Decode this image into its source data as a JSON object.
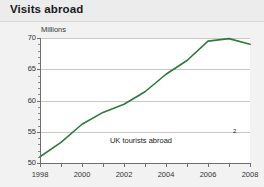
{
  "header": {
    "title": "Visits abroad"
  },
  "chart_data": {
    "type": "line",
    "title": "Visits abroad",
    "xlabel": "",
    "ylabel": "Millions",
    "units_label": "Millions",
    "xlim": [
      1998,
      2008
    ],
    "ylim": [
      50,
      70
    ],
    "grid": true,
    "legend_position": "none",
    "x_tick_labels": [
      "1998",
      "2000",
      "2002",
      "2004",
      "2006",
      "2008"
    ],
    "x_tick_values": [
      1998,
      2000,
      2002,
      2004,
      2006,
      2008
    ],
    "x_minor_tick_values": [
      1999,
      2001,
      2003,
      2005,
      2007
    ],
    "y_tick_labels": [
      "50",
      "55",
      "60",
      "65",
      "70"
    ],
    "y_tick_values": [
      50,
      55,
      60,
      65,
      70
    ],
    "series": [
      {
        "name": "UK tourists abroad",
        "color": "#2f7a3a",
        "x": [
          1998,
          1999,
          2000,
          2001,
          2002,
          2003,
          2004,
          2005,
          2006,
          2007,
          2008
        ],
        "values": [
          51.0,
          53.3,
          56.2,
          58.1,
          59.4,
          61.4,
          64.2,
          66.4,
          69.5,
          69.9,
          69.0
        ]
      }
    ],
    "annotations": [
      {
        "text": "UK tourists abroad",
        "footnote_marker": "2",
        "x": 2005.5,
        "y": 53.0
      }
    ]
  },
  "colors": {
    "line": "#2f7a3a",
    "grid": "#c9c9c9",
    "axis": "#6e6e6e",
    "header_background": "#ececec",
    "plot_background": "#ffffff",
    "page_background": "#f2f2f2",
    "text": "#333333"
  }
}
